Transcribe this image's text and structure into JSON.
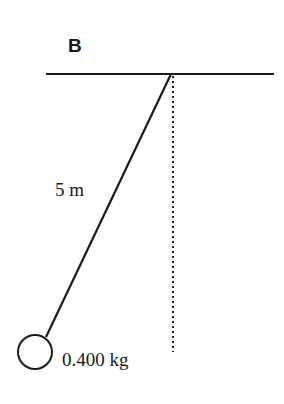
{
  "diagram": {
    "title": "B",
    "type": "pendulum",
    "string_length_label": "5 m",
    "mass_label": "0.400 kg",
    "colors": {
      "stroke": "#1a1a1a",
      "background": "#ffffff"
    },
    "elements": {
      "ceiling": {
        "x1": 46,
        "y1": 74,
        "x2": 274,
        "y2": 74
      },
      "pivot": {
        "x": 171,
        "y": 74
      },
      "string": {
        "x1": 171,
        "y1": 74,
        "x2": 46,
        "y2": 337
      },
      "vertical_reference": {
        "x1": 173,
        "y1": 76,
        "x2": 173,
        "y2": 352,
        "style": "dotted"
      },
      "bob": {
        "cx": 35,
        "cy": 352,
        "r": 17
      }
    }
  }
}
